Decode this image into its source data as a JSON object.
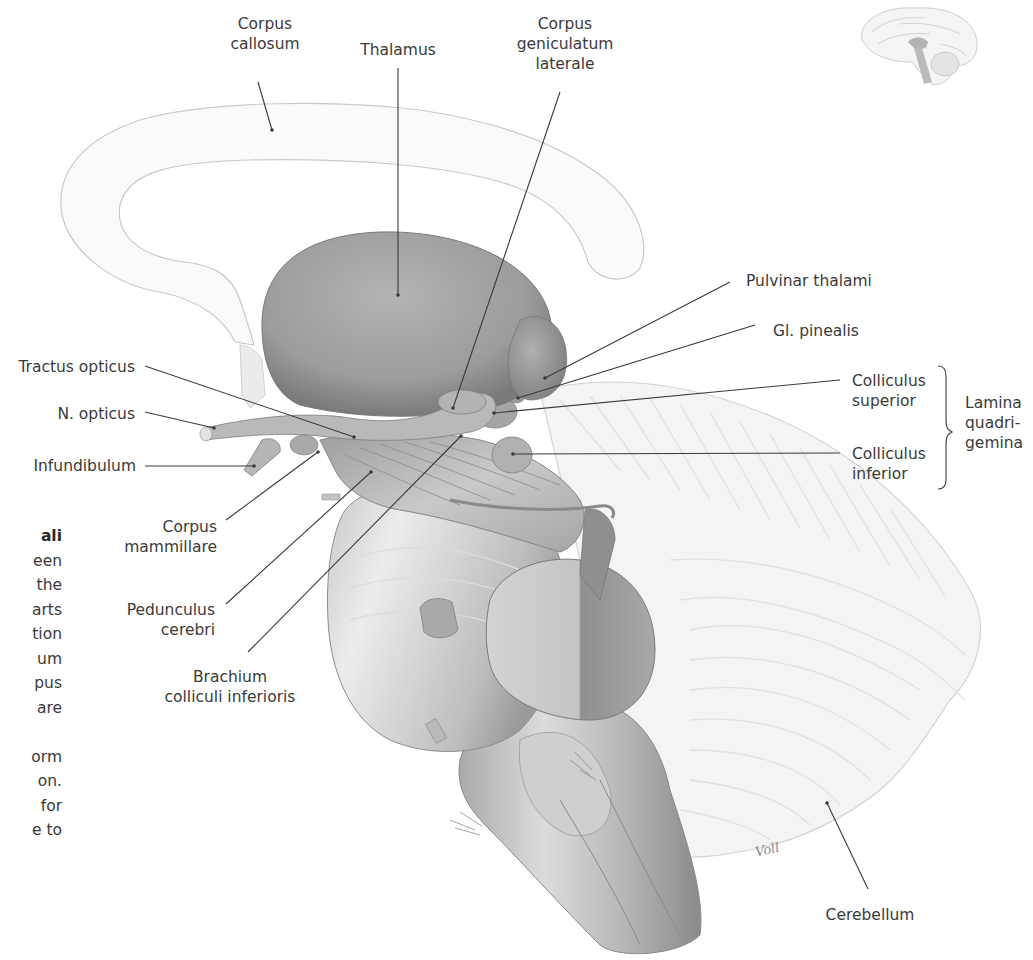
{
  "figure": {
    "signature": "Voll",
    "labels": {
      "corpus_callosum": [
        "Corpus",
        "callosum"
      ],
      "thalamus": "Thalamus",
      "corpus_geniculatum_laterale": [
        "Corpus",
        "geniculatum",
        "laterale"
      ],
      "pulvinar_thalami": "Pulvinar thalami",
      "gl_pinealis": "Gl. pinealis",
      "colliculus_superior": [
        "Colliculus",
        "superior"
      ],
      "colliculus_inferior": [
        "Colliculus",
        "inferior"
      ],
      "lamina_quadrigemina": [
        "Lamina",
        "quadri-",
        "gemina"
      ],
      "tractus_opticus": "Tractus opticus",
      "n_opticus": "N. opticus",
      "infundibulum": "Infundibulum",
      "corpus_mammillare": [
        "Corpus",
        "mammillare"
      ],
      "pedunculus_cerebri": [
        "Pedunculus",
        "cerebri"
      ],
      "brachium_colliculi_inferioris": [
        "Brachium",
        "colliculi inferioris"
      ],
      "cerebellum": "Cerebellum"
    }
  },
  "side_text": {
    "lines": [
      {
        "text": "ali",
        "bold": true
      },
      {
        "text": "een"
      },
      {
        "text": "the"
      },
      {
        "text": "arts"
      },
      {
        "text": "tion"
      },
      {
        "text": "um"
      },
      {
        "text": "pus"
      },
      {
        "text": "are"
      },
      {
        "text": ""
      },
      {
        "text": "orm"
      },
      {
        "text": "on."
      },
      {
        "text": "for"
      },
      {
        "text": "e to"
      }
    ]
  }
}
